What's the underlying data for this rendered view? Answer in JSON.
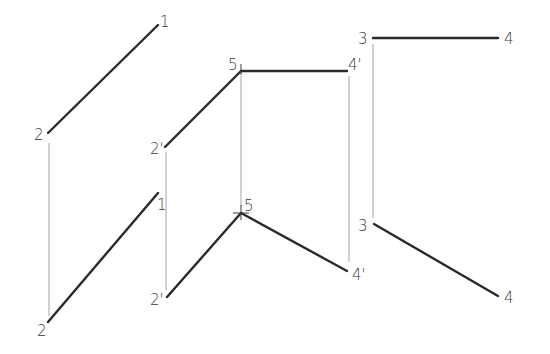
{
  "diagram": {
    "title": "",
    "panels": [
      {
        "id": "panel-line-1-2",
        "top_view": {
          "segments": [
            {
              "from": "2",
              "to": "1"
            }
          ],
          "labels": {
            "p1": "1",
            "p2": "2"
          }
        },
        "front_view": {
          "segments": [
            {
              "from": "2",
              "to": "1"
            }
          ],
          "labels": {
            "p1": "1",
            "p2": "2"
          }
        }
      },
      {
        "id": "panel-bent-line-2-5-4",
        "top_view": {
          "segments": [
            {
              "from": "2'",
              "to": "5"
            },
            {
              "from": "5",
              "to": "4'"
            }
          ],
          "labels": {
            "p2": "2'",
            "p5": "5",
            "p4": "4'"
          }
        },
        "front_view": {
          "segments": [
            {
              "from": "2'",
              "to": "5"
            },
            {
              "from": "5",
              "to": "4'"
            }
          ],
          "labels": {
            "p2": "2'",
            "p5": "5",
            "p4": "4'"
          }
        }
      },
      {
        "id": "panel-line-3-4",
        "top_view": {
          "segments": [
            {
              "from": "3",
              "to": "4"
            }
          ],
          "labels": {
            "p3": "3",
            "p4": "4"
          }
        },
        "front_view": {
          "segments": [
            {
              "from": "3",
              "to": "4"
            }
          ],
          "labels": {
            "p3": "3",
            "p4": "4"
          }
        }
      }
    ],
    "colors": {
      "object_line": "#2a2a2a",
      "projection_line": "#9a9a9a",
      "label": "#3a3a3a",
      "background": "#ffffff"
    }
  }
}
